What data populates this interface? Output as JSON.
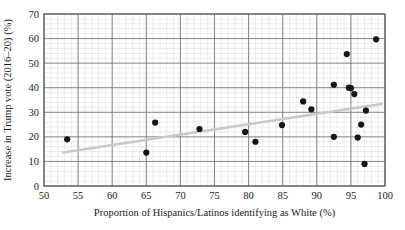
{
  "chart_data": {
    "type": "scatter",
    "title": "",
    "xlabel": "Proportion of Hispanics/Latinos identifying as White (%)",
    "ylabel": "Increase in Trump vote (2016–20) (%)",
    "xlim": [
      50,
      100
    ],
    "ylim": [
      0,
      70
    ],
    "x_major_ticks": [
      50,
      55,
      60,
      65,
      70,
      75,
      80,
      85,
      90,
      95,
      100
    ],
    "y_major_ticks": [
      0,
      10,
      20,
      30,
      40,
      50,
      60,
      70
    ],
    "x_minor_step": 1,
    "y_minor_step": 2,
    "grid": true,
    "legend": "none",
    "point_color": "#161616",
    "trendline_color": "#c9c9c9",
    "grid_major_color": "#6d6d6d",
    "grid_minor_color": "#d8d8d8",
    "points": [
      {
        "x": 53.4,
        "y": 19.0
      },
      {
        "x": 65.0,
        "y": 13.6
      },
      {
        "x": 66.3,
        "y": 25.8
      },
      {
        "x": 72.8,
        "y": 23.2
      },
      {
        "x": 79.5,
        "y": 22.0
      },
      {
        "x": 81.0,
        "y": 18.0
      },
      {
        "x": 84.9,
        "y": 24.8
      },
      {
        "x": 88.0,
        "y": 34.4
      },
      {
        "x": 89.2,
        "y": 31.2
      },
      {
        "x": 92.5,
        "y": 20.0
      },
      {
        "x": 92.5,
        "y": 41.2
      },
      {
        "x": 94.4,
        "y": 53.7
      },
      {
        "x": 94.7,
        "y": 40.0
      },
      {
        "x": 95.0,
        "y": 39.8
      },
      {
        "x": 95.5,
        "y": 37.4
      },
      {
        "x": 96.0,
        "y": 19.7
      },
      {
        "x": 96.5,
        "y": 25.0
      },
      {
        "x": 97.0,
        "y": 9.0
      },
      {
        "x": 97.2,
        "y": 30.7
      },
      {
        "x": 98.7,
        "y": 59.7
      }
    ],
    "trendline": {
      "x1": 52.8,
      "y1": 13.6,
      "x2": 99.5,
      "y2": 33.4
    }
  },
  "axis": {
    "x_tick_labels": [
      "50",
      "55",
      "60",
      "65",
      "70",
      "75",
      "80",
      "85",
      "90",
      "95",
      "100"
    ],
    "y_tick_labels": [
      "0",
      "10",
      "20",
      "30",
      "40",
      "50",
      "60",
      "70"
    ],
    "x_axis_title": "Proportion of Hispanics/Latinos identifying as White (%)",
    "y_axis_title": "Increase in Trump vote (2016–20) (%)"
  }
}
